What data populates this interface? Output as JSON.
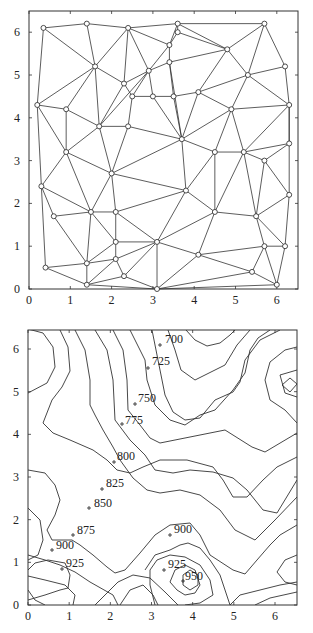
{
  "chart_data": [
    {
      "type": "scatter",
      "title": "",
      "subtitle": "Delaunay triangulation of sample points",
      "xlabel": "",
      "ylabel": "",
      "xlim": [
        0,
        6.5
      ],
      "ylim": [
        0,
        6.5
      ],
      "xticks": [
        "0",
        "1",
        "2",
        "3",
        "4",
        "5",
        "6"
      ],
      "yticks": [
        "0",
        "1",
        "2",
        "3",
        "4",
        "5",
        "6"
      ],
      "grid": false,
      "frame": {
        "left": 29,
        "right": 298,
        "top": 11,
        "bottom": 289,
        "x0px": 29,
        "xScale": 41.3,
        "y0px": 289,
        "yScale": 42.8
      },
      "points": [
        [
          0.35,
          6.1
        ],
        [
          1.4,
          6.2
        ],
        [
          2.4,
          6.1
        ],
        [
          3.6,
          6.2
        ],
        [
          3.6,
          6.0
        ],
        [
          3.4,
          5.7
        ],
        [
          5.7,
          6.2
        ],
        [
          4.8,
          5.6
        ],
        [
          1.6,
          5.2
        ],
        [
          2.9,
          5.1
        ],
        [
          3.4,
          5.3
        ],
        [
          2.3,
          4.8
        ],
        [
          2.5,
          4.5
        ],
        [
          3.0,
          4.5
        ],
        [
          3.5,
          4.5
        ],
        [
          4.1,
          4.6
        ],
        [
          5.3,
          5.0
        ],
        [
          6.2,
          5.2
        ],
        [
          0.2,
          4.3
        ],
        [
          0.9,
          4.2
        ],
        [
          1.7,
          3.8
        ],
        [
          2.4,
          3.8
        ],
        [
          3.7,
          3.5
        ],
        [
          4.9,
          4.2
        ],
        [
          6.3,
          4.3
        ],
        [
          0.9,
          3.2
        ],
        [
          2.0,
          2.7
        ],
        [
          4.5,
          3.2
        ],
        [
          5.2,
          3.2
        ],
        [
          6.3,
          3.4
        ],
        [
          5.7,
          3.0
        ],
        [
          0.3,
          2.4
        ],
        [
          3.8,
          2.3
        ],
        [
          6.3,
          2.2
        ],
        [
          0.6,
          1.7
        ],
        [
          1.5,
          1.8
        ],
        [
          2.1,
          1.8
        ],
        [
          4.5,
          1.8
        ],
        [
          5.5,
          1.7
        ],
        [
          2.1,
          1.1
        ],
        [
          3.1,
          1.1
        ],
        [
          5.7,
          1.0
        ],
        [
          6.2,
          1.0
        ],
        [
          4.1,
          0.8
        ],
        [
          0.4,
          0.5
        ],
        [
          1.4,
          0.6
        ],
        [
          2.1,
          0.7
        ],
        [
          2.3,
          0.3
        ],
        [
          5.4,
          0.4
        ],
        [
          1.4,
          0.1
        ],
        [
          3.1,
          0.0
        ],
        [
          6.0,
          0.1
        ]
      ],
      "edges": [
        [
          0,
          1
        ],
        [
          1,
          2
        ],
        [
          2,
          3
        ],
        [
          3,
          6
        ],
        [
          0,
          18
        ],
        [
          0,
          8
        ],
        [
          1,
          8
        ],
        [
          2,
          8
        ],
        [
          2,
          11
        ],
        [
          2,
          9
        ],
        [
          2,
          5
        ],
        [
          3,
          4
        ],
        [
          4,
          5
        ],
        [
          3,
          7
        ],
        [
          4,
          7
        ],
        [
          5,
          9
        ],
        [
          5,
          10
        ],
        [
          3,
          5
        ],
        [
          6,
          7
        ],
        [
          6,
          16
        ],
        [
          6,
          17
        ],
        [
          7,
          10
        ],
        [
          7,
          15
        ],
        [
          7,
          16
        ],
        [
          8,
          18
        ],
        [
          8,
          19
        ],
        [
          8,
          20
        ],
        [
          8,
          11
        ],
        [
          9,
          11
        ],
        [
          9,
          10
        ],
        [
          9,
          12
        ],
        [
          9,
          13
        ],
        [
          9,
          20
        ],
        [
          10,
          14
        ],
        [
          10,
          22
        ],
        [
          11,
          12
        ],
        [
          11,
          20
        ],
        [
          12,
          13
        ],
        [
          12,
          21
        ],
        [
          13,
          14
        ],
        [
          13,
          22
        ],
        [
          14,
          15
        ],
        [
          14,
          22
        ],
        [
          15,
          16
        ],
        [
          15,
          22
        ],
        [
          15,
          23
        ],
        [
          16,
          17
        ],
        [
          16,
          23
        ],
        [
          16,
          24
        ],
        [
          17,
          24
        ],
        [
          18,
          19
        ],
        [
          18,
          25
        ],
        [
          18,
          31
        ],
        [
          19,
          25
        ],
        [
          19,
          20
        ],
        [
          20,
          21
        ],
        [
          20,
          25
        ],
        [
          20,
          26
        ],
        [
          21,
          26
        ],
        [
          21,
          22
        ],
        [
          22,
          26
        ],
        [
          22,
          27
        ],
        [
          22,
          23
        ],
        [
          22,
          32
        ],
        [
          23,
          24
        ],
        [
          23,
          27
        ],
        [
          23,
          28
        ],
        [
          24,
          28
        ],
        [
          24,
          29
        ],
        [
          28,
          29
        ],
        [
          28,
          30
        ],
        [
          29,
          30
        ],
        [
          30,
          33
        ],
        [
          30,
          38
        ],
        [
          28,
          37
        ],
        [
          28,
          38
        ],
        [
          27,
          28
        ],
        [
          27,
          37
        ],
        [
          27,
          32
        ],
        [
          25,
          26
        ],
        [
          25,
          31
        ],
        [
          25,
          35
        ],
        [
          26,
          35
        ],
        [
          26,
          36
        ],
        [
          26,
          32
        ],
        [
          31,
          34
        ],
        [
          31,
          35
        ],
        [
          31,
          44
        ],
        [
          34,
          35
        ],
        [
          34,
          45
        ],
        [
          35,
          36
        ],
        [
          35,
          45
        ],
        [
          36,
          39
        ],
        [
          36,
          40
        ],
        [
          36,
          32
        ],
        [
          32,
          40
        ],
        [
          32,
          37
        ],
        [
          33,
          24
        ],
        [
          33,
          38
        ],
        [
          33,
          42
        ],
        [
          37,
          40
        ],
        [
          37,
          43
        ],
        [
          37,
          38
        ],
        [
          38,
          41
        ],
        [
          38,
          42
        ],
        [
          41,
          42
        ],
        [
          41,
          43
        ],
        [
          41,
          48
        ],
        [
          41,
          51
        ],
        [
          42,
          51
        ],
        [
          43,
          40
        ],
        [
          43,
          48
        ],
        [
          43,
          50
        ],
        [
          40,
          39
        ],
        [
          40,
          46
        ],
        [
          40,
          47
        ],
        [
          40,
          50
        ],
        [
          39,
          45
        ],
        [
          39,
          46
        ],
        [
          45,
          46
        ],
        [
          45,
          49
        ],
        [
          44,
          45
        ],
        [
          44,
          49
        ],
        [
          46,
          49
        ],
        [
          46,
          47
        ],
        [
          47,
          49
        ],
        [
          47,
          50
        ],
        [
          49,
          50
        ],
        [
          50,
          48
        ],
        [
          50,
          51
        ],
        [
          48,
          51
        ],
        [
          35,
          39
        ]
      ]
    },
    {
      "type": "contour",
      "title": "",
      "xlabel": "",
      "ylabel": "",
      "xlim": [
        0,
        6.5
      ],
      "ylim": [
        0,
        6.5
      ],
      "xticks": [
        "0",
        "1",
        "2",
        "3",
        "4",
        "5",
        "6"
      ],
      "yticks": [
        "0",
        "1",
        "2",
        "3",
        "4",
        "5",
        "6"
      ],
      "grid": false,
      "levels": [
        700,
        725,
        750,
        775,
        800,
        825,
        850,
        875,
        900,
        925,
        950
      ],
      "frame": {
        "left": 28,
        "right": 297,
        "top": 330,
        "bottom": 605
      },
      "contour_paths": [
        "M28,329 L43,333 L53,347 L55,367 L47,383 L28,393",
        "M60,330 L68,347 L70,371 L62,387 L52,400 L43,423 L53,433 L70,440 L93,450 L107,460 L117,470 L130,473 L143,467 L160,460 L187,460 L213,467 L223,480 L233,497 L247,497 L263,480 L277,467 L297,457",
        "M75,330 L85,350 L90,380 L90,405 L95,415 L103,430 L113,447 L120,460 L133,478 L147,490 L160,493 L180,490 L200,495 L220,510 L235,530 L255,540 L275,520 L297,497",
        "M95,330 L107,350 L113,380 L115,420 L130,440 L145,455 L155,470 L173,473 L190,470 L213,472 L233,478 L247,490 L263,510 L277,513 L297,480",
        "M113,330 L123,350 L127,380 L128,410 L140,425 L150,438 L160,443 L175,440 L200,435 L225,430 L252,447 L265,452 L297,433",
        "M130,330 L145,360 L147,380 L155,405 L170,420 L185,425 L200,415 L215,410 L233,390 L245,373 L250,350 L258,338 L270,330",
        "M152,330 L160,370 L165,395 L173,412 L185,420 L200,418 L215,400 L233,392 L240,382 L245,360 L260,340 L280,330",
        "M168,330 L175,350 L181,370 L195,380 L205,375 L225,365 L237,345 L250,330",
        "M186,330 L195,340 L207,346 L220,343 L230,335 L235,330",
        "M297,347 L285,350 L270,362 L265,380 L270,400 L285,410 L297,423",
        "M297,370 L280,375 L285,393 L297,397",
        "M282,385 L290,378 L297,384 L290,392 Z",
        "M28,470 L45,473 L55,485 L60,500 L55,515 L47,530 L52,540 L72,540 L80,545 L93,555 L107,567 L115,573 L125,570 L140,553 L155,535 L170,525 L190,523 L200,535 L210,555 L233,570 L245,574 L257,560 L270,545 L280,535 L297,525",
        "M28,508 L40,520 L43,540 L38,555 L28,560",
        "M28,555 L45,560 L60,565 L75,572 L90,582 L113,595 L118,605",
        "M28,576 L45,580 L65,585 L75,595 L73,605",
        "M28,590 L35,600 L45,605",
        "M28,600 L45,595 L60,590 L68,588 L70,575 L65,563 L48,560 L35,563 L28,570",
        "M120,605 L130,590 L143,585 L153,595 L158,605",
        "M95,605 L110,590 L118,582 L133,575 L150,578 L165,592 L178,605",
        "M145,570 L155,555 L170,550 L180,545 L188,543 L200,548 L210,560 L220,575 L225,590 L230,605",
        "M155,605 L150,585 L150,570 L157,560 L170,555 L185,557 L200,565 L210,580 L213,595 L200,603 L185,605",
        "M170,582 L175,570 L185,565 L195,570 L200,585 L195,593 L185,595 L177,590 Z",
        "M183,575 L190,570 L198,575 L198,585 L190,590 L183,585 Z",
        "M230,605 L240,595 L260,590 L280,585 L297,582",
        "M255,605 L270,598 L297,592",
        "M297,555 L285,560 L277,572 L285,582 L297,585"
      ],
      "labels": [
        {
          "text": "700",
          "x": 165,
          "y": 343,
          "mark": [
            160,
            345
          ]
        },
        {
          "text": "725",
          "x": 152,
          "y": 365,
          "mark": [
            148,
            368
          ]
        },
        {
          "text": "750",
          "x": 138,
          "y": 402,
          "mark": [
            135,
            404
          ]
        },
        {
          "text": "775",
          "x": 125,
          "y": 424,
          "mark": [
            122,
            424
          ]
        },
        {
          "text": "800",
          "x": 117,
          "y": 460,
          "mark": [
            114,
            462
          ]
        },
        {
          "text": "825",
          "x": 106,
          "y": 487,
          "mark": [
            102,
            489
          ]
        },
        {
          "text": "850",
          "x": 94,
          "y": 507,
          "mark": [
            89,
            508
          ]
        },
        {
          "text": "875",
          "x": 77,
          "y": 534,
          "mark": [
            73,
            535
          ]
        },
        {
          "text": "900",
          "x": 56,
          "y": 549,
          "mark": [
            52,
            550
          ]
        },
        {
          "text": "925",
          "x": 66,
          "y": 567,
          "mark": [
            62,
            569
          ]
        },
        {
          "text": "900",
          "x": 174,
          "y": 533,
          "mark": [
            170,
            535
          ]
        },
        {
          "text": "925",
          "x": 168,
          "y": 568,
          "mark": [
            164,
            570
          ]
        },
        {
          "text": "950",
          "x": 185,
          "y": 580,
          "mark": [
            183,
            581
          ]
        }
      ]
    }
  ]
}
